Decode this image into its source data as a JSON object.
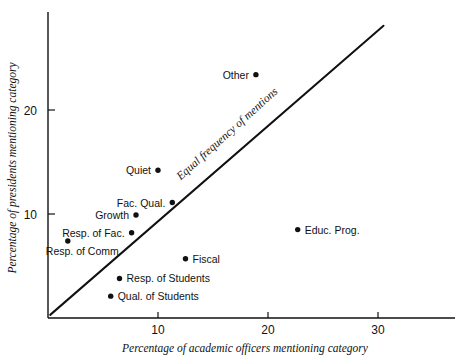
{
  "chart_data": {
    "type": "scatter",
    "title": "",
    "xlabel": "Percentage of academic officers mentioning category",
    "ylabel": "Percentage of presidents mentioning category",
    "xlim": [
      0,
      34
    ],
    "ylim": [
      0,
      28
    ],
    "xticks": [
      10,
      20,
      30
    ],
    "yticks": [
      10,
      20
    ],
    "xticklabels": [
      "10",
      "20",
      "30"
    ],
    "yticklabels": [
      "10",
      "20"
    ],
    "grid": false,
    "legend": "none",
    "annotations": [
      {
        "name": "identity-line-label",
        "text": "Equal frequency of mentions",
        "rotation": -42
      }
    ],
    "reference_line": {
      "name": "equal-frequency-line",
      "label": "Equal frequency of mentions",
      "type": "identity",
      "from": [
        0.2,
        0.3
      ],
      "to": [
        30.5,
        28.1
      ]
    },
    "points": [
      {
        "label": "Other",
        "x": 18.9,
        "y": 23.4,
        "label_side": "left"
      },
      {
        "label": "Quiet",
        "x": 10.0,
        "y": 14.2,
        "label_side": "left"
      },
      {
        "label": "Fac. Qual.",
        "x": 11.3,
        "y": 11.1,
        "label_side": "left"
      },
      {
        "label": "Growth",
        "x": 8.0,
        "y": 9.9,
        "label_side": "left"
      },
      {
        "label": "Resp. of Fac.",
        "x": 7.6,
        "y": 8.2,
        "label_side": "left"
      },
      {
        "label": "Resp. of Comm.",
        "x": 1.8,
        "y": 7.4,
        "label_side": "below"
      },
      {
        "label": "Educ. Prog.",
        "x": 22.7,
        "y": 8.5,
        "label_side": "right"
      },
      {
        "label": "Fiscal",
        "x": 12.5,
        "y": 5.7,
        "label_side": "right"
      },
      {
        "label": "Resp. of Students",
        "x": 6.5,
        "y": 3.8,
        "label_side": "right"
      },
      {
        "label": "Qual. of Students",
        "x": 5.7,
        "y": 2.1,
        "label_side": "right"
      }
    ]
  },
  "colors": {
    "ink": "#111111",
    "background": "#ffffff"
  }
}
